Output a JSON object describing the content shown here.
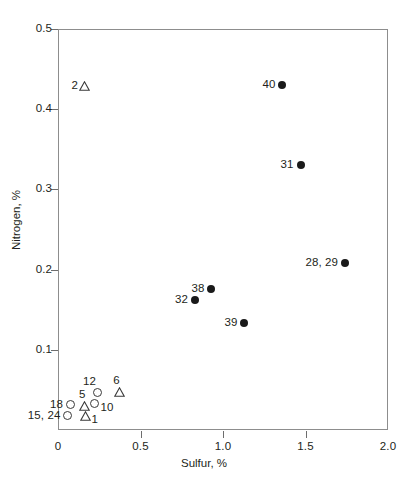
{
  "chart_data": {
    "type": "scatter",
    "title": "",
    "xlabel": "Sulfur, %",
    "ylabel": "Nitrogen, %",
    "xlim": [
      0,
      2.0
    ],
    "ylim": [
      0,
      0.5
    ],
    "xticks": [
      "0",
      "0.5",
      "1.0",
      "1.5",
      "2.0"
    ],
    "xtick_values": [
      0,
      0.5,
      1.0,
      1.5,
      2.0
    ],
    "yticks": [
      "0.1",
      "0.2",
      "0.3",
      "0.4",
      "0.5"
    ],
    "ytick_values": [
      0.1,
      0.2,
      0.3,
      0.4,
      0.5
    ],
    "grid": false,
    "legend": null,
    "series": [
      {
        "name": "filled-circle",
        "marker": "filled-circle",
        "points": [
          {
            "label": "40",
            "x": 1.36,
            "y": 0.43,
            "label_pos": "left"
          },
          {
            "label": "31",
            "x": 1.47,
            "y": 0.33,
            "label_pos": "left"
          },
          {
            "label": "28, 29",
            "x": 1.74,
            "y": 0.208,
            "label_pos": "left"
          },
          {
            "label": "38",
            "x": 0.93,
            "y": 0.176,
            "label_pos": "left"
          },
          {
            "label": "32",
            "x": 0.83,
            "y": 0.162,
            "label_pos": "left"
          },
          {
            "label": "39",
            "x": 1.13,
            "y": 0.133,
            "label_pos": "left"
          }
        ]
      },
      {
        "name": "open-triangle",
        "marker": "open-triangle",
        "points": [
          {
            "label": "2",
            "x": 0.163,
            "y": 0.429,
            "label_pos": "left"
          },
          {
            "label": "6",
            "x": 0.371,
            "y": 0.0475,
            "label_pos": "above"
          },
          {
            "label": "5",
            "x": 0.163,
            "y": 0.0305,
            "label_pos": "above"
          },
          {
            "label": "1",
            "x": 0.166,
            "y": 0.0175,
            "label_pos": "right-low"
          }
        ]
      },
      {
        "name": "open-circle",
        "marker": "open-circle",
        "points": [
          {
            "label": "12",
            "x": 0.242,
            "y": 0.0472,
            "label_pos": "above-left"
          },
          {
            "label": "10",
            "x": 0.221,
            "y": 0.0325,
            "label_pos": "right-low"
          },
          {
            "label": "18",
            "x": 0.073,
            "y": 0.0315,
            "label_pos": "left"
          },
          {
            "label": "15, 24",
            "x": 0.057,
            "y": 0.0175,
            "label_pos": "left"
          }
        ]
      }
    ]
  },
  "colors": {
    "marker_fill": "#1a1a1a",
    "marker_stroke": "#3a3a3a",
    "axis": "#8d8d8d",
    "text": "#231f20",
    "background": "#ffffff"
  }
}
